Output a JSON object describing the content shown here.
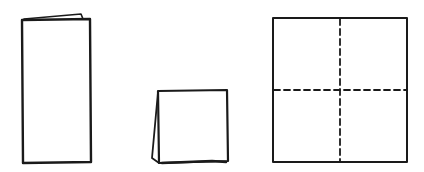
{
  "diagram": {
    "title": "",
    "description_visible_text": [],
    "ink_color": "#1a1a1a",
    "background_color": "#ffffff",
    "steps": [
      {
        "id": "step-1",
        "shape": "tall-folded-rectangle",
        "label": "",
        "rect": {
          "x": 22,
          "y": 19,
          "w": 68,
          "h": 144
        },
        "flap_tip": {
          "x": 82,
          "y": 14
        }
      },
      {
        "id": "step-2",
        "shape": "folded-square",
        "label": "",
        "rect": {
          "x": 158,
          "y": 90,
          "w": 70,
          "h": 73
        },
        "flap_left_bottom": {
          "x": 153,
          "y": 160
        }
      },
      {
        "id": "step-3",
        "shape": "unfolded-square-with-crease-lines",
        "label": "",
        "rect": {
          "x": 273,
          "y": 18,
          "w": 134,
          "h": 144
        },
        "crease_vertical_x": 340,
        "crease_horizontal_y": 90,
        "crease_style": "dashed"
      }
    ]
  }
}
